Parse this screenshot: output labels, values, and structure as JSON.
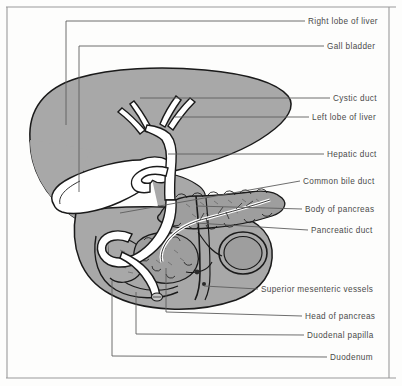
{
  "figure": {
    "background_color": "#fdfdfc",
    "frame_color": "#9a9a9a",
    "organ_fill": "#a8a8a8",
    "organ_stroke": "#1a1a1a",
    "duct_fill": "#ffffff",
    "leader_color": "#5d5d5d",
    "label_color": "#4a4a4a"
  },
  "labels": [
    {
      "id": "right-lobe-of-liver",
      "text": "Right lobe  of liver",
      "x": 308,
      "y": 24
    },
    {
      "id": "gall-bladder",
      "text": "Gall bladder",
      "x": 327,
      "y": 49
    },
    {
      "id": "cystic-duct",
      "text": "Cystic duct",
      "x": 333,
      "y": 101
    },
    {
      "id": "left-lobe-of-liver",
      "text": "Left lobe of liver",
      "x": 312,
      "y": 120
    },
    {
      "id": "hepatic-duct",
      "text": "Hepatic duct",
      "x": 327,
      "y": 157
    },
    {
      "id": "common-bile-duct",
      "text": "Common bile duct",
      "x": 303,
      "y": 184
    },
    {
      "id": "body-of-pancreas",
      "text": "Body of pancreas",
      "x": 305,
      "y": 212
    },
    {
      "id": "pancreatic-duct",
      "text": "Pancreatic duct",
      "x": 311,
      "y": 233
    },
    {
      "id": "superior-mesenteric-vessels",
      "text": "Superior mesenteric vessels",
      "x": 261,
      "y": 292
    },
    {
      "id": "head-of-pancreas",
      "text": "Head of pancreas",
      "x": 305,
      "y": 319
    },
    {
      "id": "duodenal-papilla",
      "text": "Duodenal papilla",
      "x": 307,
      "y": 338
    },
    {
      "id": "duodenum",
      "text": "Duodenum",
      "x": 330,
      "y": 360
    }
  ],
  "structures": [
    {
      "id": "liver",
      "name": "Liver",
      "fill": "#a8a8a8"
    },
    {
      "id": "gallbladder",
      "name": "Gall bladder",
      "fill": "#ffffff"
    },
    {
      "id": "bile-ducts",
      "name": "Biliary duct tree",
      "fill": "#ffffff"
    },
    {
      "id": "pancreas",
      "name": "Pancreas",
      "fill": "#9e9e9e"
    },
    {
      "id": "duodenum",
      "name": "Duodenum (C-loop)",
      "fill": "#a8a8a8"
    },
    {
      "id": "sm-vessels",
      "name": "Superior mesenteric vessels",
      "fill": "#a8a8a8"
    }
  ]
}
